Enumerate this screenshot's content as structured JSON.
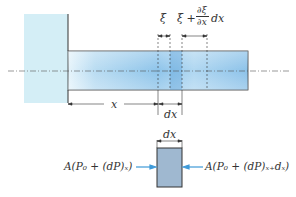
{
  "labels": {
    "xi": "ξ",
    "xi_plus": "ξ +",
    "partial_num": "∂ξ",
    "partial_den": "∂x",
    "partial_dx": "dx",
    "x": "x",
    "dx_bottom": "dx",
    "dx_element": "dx",
    "force_left": "A(P₀ + (dP)ₓ)",
    "force_right": "A(P₀ + (dP)ₓ₊dₓ)"
  },
  "colors": {
    "wall": "#d4eef6",
    "bar": "#8ec4ea",
    "element": "#9fb8d0",
    "arrow": "#3f9ad8",
    "line": "#333333"
  }
}
